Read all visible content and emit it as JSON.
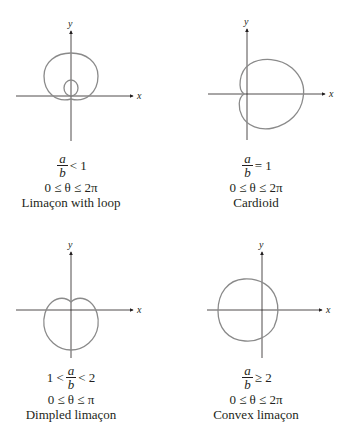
{
  "figure": {
    "axis_labels": {
      "x": "x",
      "y": "y"
    },
    "curve_color": "#8a8a8a",
    "panels": [
      {
        "id": "limacon-with-loop",
        "ratio_left": "",
        "ratio_num": "a",
        "ratio_den": "b",
        "ratio_right": "< 1",
        "range": "0 ≤ θ ≤ 2π",
        "name": "Limaçon with loop"
      },
      {
        "id": "cardioid",
        "ratio_left": "",
        "ratio_num": "a",
        "ratio_den": "b",
        "ratio_right": "= 1",
        "range": "0 ≤ θ ≤ 2π",
        "name": "Cardioid"
      },
      {
        "id": "dimpled-limacon",
        "ratio_left": "1 <",
        "ratio_num": "a",
        "ratio_den": "b",
        "ratio_right": "< 2",
        "range": "0 ≤ θ ≤ π",
        "name": "Dimpled limaçon"
      },
      {
        "id": "convex-limacon",
        "ratio_left": "",
        "ratio_num": "a",
        "ratio_den": "b",
        "ratio_right": "≥ 2",
        "range": "0 ≤ θ ≤ 2π",
        "name": "Convex limaçon"
      }
    ]
  }
}
